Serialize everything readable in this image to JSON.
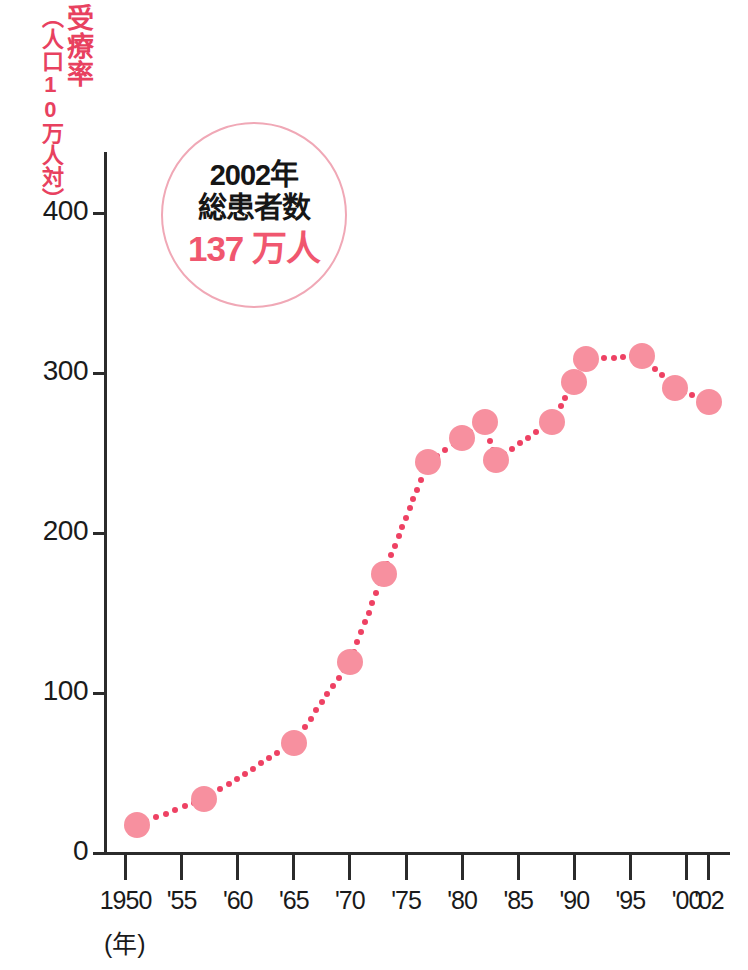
{
  "chart_data": {
    "type": "line",
    "title": "",
    "xlabel": "(年)",
    "ylabel": "受療率（人口10万人対）",
    "ylabel_main": "受療率",
    "ylabel_sub": "（人口10万人対）",
    "xlim": [
      1950,
      2002
    ],
    "ylim": [
      0,
      400
    ],
    "grid": false,
    "legend": "none",
    "marker": "filled-circle",
    "line_style": "dotted",
    "series_color": "#f7909f",
    "line_color": "#ee4163",
    "x_tick_labels": [
      "1950",
      "'55",
      "'60",
      "'65",
      "'70",
      "'75",
      "'80",
      "'85",
      "'90",
      "'95",
      "'00",
      "'02"
    ],
    "x_tick_values": [
      1950,
      1955,
      1960,
      1965,
      1970,
      1975,
      1980,
      1985,
      1990,
      1995,
      2000,
      2002
    ],
    "y_tick_labels": [
      "0",
      "100",
      "200",
      "300",
      "400"
    ],
    "y_tick_values": [
      0,
      100,
      200,
      300,
      400
    ],
    "series": [
      {
        "name": "受療率",
        "x": [
          1951,
          1957,
          1965,
          1970,
          1973,
          1977,
          1980,
          1982,
          1983,
          1988,
          1990,
          1991,
          1996,
          1999,
          2002
        ],
        "values": [
          18,
          34,
          69,
          120,
          175,
          245,
          260,
          270,
          246,
          270,
          295,
          309,
          311,
          291,
          282
        ]
      }
    ]
  },
  "annotation": {
    "name": "total-patients-callout",
    "line1": "2002年",
    "line2": "総患者数",
    "value": "137 万人",
    "border_color": "#f0a8b6",
    "value_color": "#f0576f"
  },
  "axis": {
    "y_unit_note": "人口10万人対",
    "x_unit_note": "（年）"
  },
  "colors": {
    "marker": "#f7909f",
    "line": "#ee4163",
    "axis": "#2b2b2b",
    "label_red": "#e8415f",
    "text": "#1a1a1a"
  },
  "top_strip_text": ""
}
